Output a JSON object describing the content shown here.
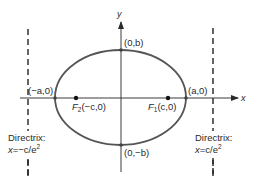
{
  "diagram": {
    "type": "ellipse-with-directrices",
    "colors": {
      "ellipse": "#555555",
      "axis": "#3a3a3a",
      "text": "#2a2a2a",
      "directrix": "#222222",
      "point": "#111111"
    },
    "axes": {
      "x_label": "x",
      "y_label": "y"
    },
    "vertices": {
      "top": "(0,b)",
      "bottom": "(0,−b)",
      "left": "(−a,0)",
      "right": "(a,0)"
    },
    "foci": {
      "f2": {
        "name": "F",
        "sub": "2",
        "coords": "(−c,0)"
      },
      "f1": {
        "name": "F",
        "sub": "1",
        "coords": "(c,0)"
      }
    },
    "directrices": {
      "left": {
        "title": "Directrix:",
        "eq_prefix": "x",
        "eq_body": "=−c/e",
        "eq_sup": "2"
      },
      "right": {
        "title": "Directrix:",
        "eq_prefix": "x",
        "eq_body": "=c/e",
        "eq_sup": "2"
      }
    }
  }
}
